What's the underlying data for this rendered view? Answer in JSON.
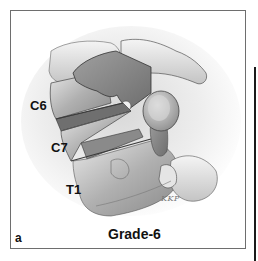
{
  "figure": {
    "panel_letter": "a",
    "caption": "Grade-6",
    "signature": "KKP",
    "labels": {
      "c6": "C6",
      "c7": "C7",
      "t1": "T1"
    },
    "colors": {
      "frame_border": "#6e6e6e",
      "bone_shadow": "#7a7a7a",
      "bone_mid": "#b5b5b5",
      "bone_light": "#e6e6e6",
      "text": "#111111"
    }
  }
}
